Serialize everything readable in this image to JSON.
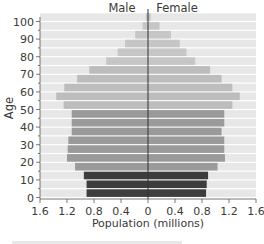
{
  "chart_data": {
    "type": "bar",
    "subtype": "population-pyramid",
    "title": "",
    "xlabel": "Population (millions)",
    "ylabel": "Age",
    "xlim": [
      -1.6,
      1.6
    ],
    "ylim": [
      0,
      100
    ],
    "x_tick_labels": [
      "1.6",
      "1.2",
      "0.8",
      "0.4",
      "0",
      "0.4",
      "0.8",
      "1.2",
      "1.6"
    ],
    "y_tick_labels": [
      "0",
      "10",
      "20",
      "30",
      "40",
      "50",
      "60",
      "70",
      "80",
      "90",
      "100"
    ],
    "legend": [
      "Male",
      "Female"
    ],
    "grid": false,
    "age_groups": [
      "0-4",
      "5-9",
      "10-14",
      "15-19",
      "20-24",
      "25-29",
      "30-34",
      "35-39",
      "40-44",
      "45-49",
      "50-54",
      "55-59",
      "60-64",
      "65-69",
      "70-74",
      "75-79",
      "80-84",
      "85-89",
      "90-94",
      "95-99",
      "100+"
    ],
    "series": [
      {
        "name": "Male",
        "values": [
          0.91,
          0.91,
          0.95,
          1.08,
          1.2,
          1.19,
          1.18,
          1.13,
          1.13,
          1.13,
          1.25,
          1.36,
          1.24,
          1.05,
          0.87,
          0.62,
          0.45,
          0.34,
          0.19,
          0.08,
          0.03
        ]
      },
      {
        "name": "Female",
        "values": [
          0.86,
          0.87,
          0.89,
          1.03,
          1.14,
          1.13,
          1.13,
          1.09,
          1.13,
          1.13,
          1.25,
          1.36,
          1.25,
          1.09,
          0.92,
          0.7,
          0.57,
          0.47,
          0.34,
          0.17,
          0.04
        ]
      }
    ],
    "band_shades": [
      "#3d3d3d",
      "#3d3d3d",
      "#3d3d3d",
      "#9a9a9a",
      "#9a9a9a",
      "#9a9a9a",
      "#9a9a9a",
      "#9a9a9a",
      "#9a9a9a",
      "#9a9a9a",
      "#bdbdbd",
      "#bdbdbd",
      "#bdbdbd",
      "#bdbdbd",
      "#bdbdbd",
      "#c6c6c6",
      "#c6c6c6",
      "#c6c6c6",
      "#c6c6c6",
      "#c6c6c6",
      "#c6c6c6"
    ],
    "background_band_color": "#e7e7e7"
  }
}
